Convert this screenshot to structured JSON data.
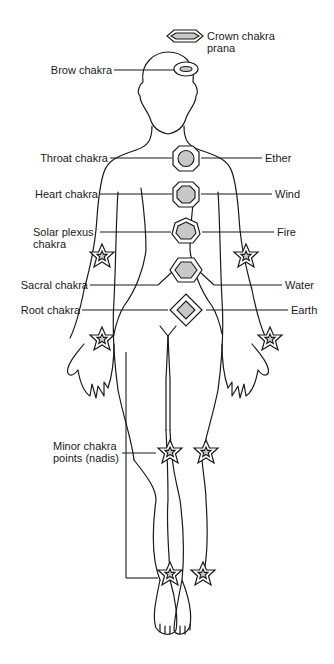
{
  "diagram": {
    "colors": {
      "line": "#1a1a1a",
      "fill": "#c8c8c8",
      "background": "#ffffff"
    },
    "labels_left": [
      {
        "id": "brow",
        "lines": [
          "Brow chakra"
        ]
      },
      {
        "id": "throat",
        "lines": [
          "Throat chakra"
        ]
      },
      {
        "id": "heart",
        "lines": [
          "Heart chakra"
        ]
      },
      {
        "id": "solar",
        "lines": [
          "Solar plexus",
          "chakra"
        ]
      },
      {
        "id": "sacral",
        "lines": [
          "Sacral chakra"
        ]
      },
      {
        "id": "root",
        "lines": [
          "Root chakra"
        ]
      },
      {
        "id": "minor",
        "lines": [
          "Minor chakra",
          "points (nadis)"
        ]
      }
    ],
    "labels_right": [
      {
        "id": "crown",
        "lines": [
          "Crown chakra",
          "prana"
        ]
      },
      {
        "id": "ether",
        "lines": [
          "Ether"
        ]
      },
      {
        "id": "wind",
        "lines": [
          "Wind"
        ]
      },
      {
        "id": "fire",
        "lines": [
          "Fire"
        ]
      },
      {
        "id": "water",
        "lines": [
          "Water"
        ]
      },
      {
        "id": "earth",
        "lines": [
          "Earth"
        ]
      }
    ],
    "chakras": [
      {
        "name": "Crown chakra",
        "element": "prana",
        "shape": "elongated-octagon"
      },
      {
        "name": "Brow chakra",
        "element": "",
        "shape": "ellipse"
      },
      {
        "name": "Throat chakra",
        "element": "Ether",
        "shape": "octagon"
      },
      {
        "name": "Heart chakra",
        "element": "Wind",
        "shape": "octagon"
      },
      {
        "name": "Solar plexus chakra",
        "element": "Fire",
        "shape": "heptagon"
      },
      {
        "name": "Sacral chakra",
        "element": "Water",
        "shape": "hexagon"
      },
      {
        "name": "Root chakra",
        "element": "Earth",
        "shape": "diamond"
      }
    ],
    "minor_points": [
      "left wrist",
      "right wrist",
      "left hand",
      "right hand",
      "left knee",
      "right knee",
      "left ankle",
      "right ankle"
    ]
  }
}
